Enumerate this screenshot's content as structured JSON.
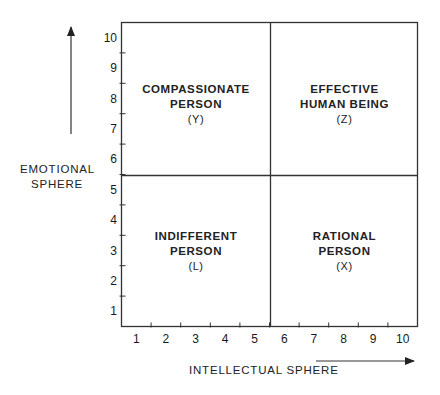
{
  "chart_data": {
    "type": "quadrant",
    "title": "",
    "xlabel": "INTELLECTUAL SPHERE",
    "ylabel": "EMOTIONAL SPHERE",
    "xlim": [
      0.5,
      10.5
    ],
    "ylim": [
      0.5,
      10.5
    ],
    "x_ticks": [
      "1",
      "2",
      "3",
      "4",
      "5",
      "6",
      "7",
      "8",
      "9",
      "10"
    ],
    "y_ticks": [
      "1",
      "2",
      "3",
      "4",
      "5",
      "6",
      "7",
      "8",
      "9",
      "10"
    ],
    "divider_x": 5.5,
    "divider_y": 5.5,
    "grid": false,
    "quadrants": [
      {
        "position": "top-left",
        "lines": [
          "COMPASSIONATE",
          "PERSON"
        ],
        "code": "(Y)"
      },
      {
        "position": "top-right",
        "lines": [
          "EFFECTIVE",
          "HUMAN BEING"
        ],
        "code": "(Z)"
      },
      {
        "position": "bottom-left",
        "lines": [
          "INDIFFERENT",
          "PERSON"
        ],
        "code": "(L)"
      },
      {
        "position": "bottom-right",
        "lines": [
          "RATIONAL",
          "PERSON"
        ],
        "code": "(X)"
      }
    ]
  },
  "axes": {
    "y_title_line1": "EMOTIONAL",
    "y_title_line2": "SPHERE",
    "x_title": "INTELLECTUAL SPHERE"
  },
  "colors": {
    "line": "#333333",
    "text": "#1a1a1a",
    "background": "#ffffff"
  }
}
